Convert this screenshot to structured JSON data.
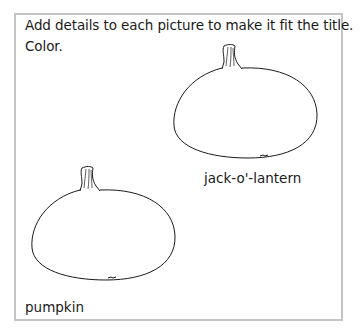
{
  "worksheet": {
    "instructions": {
      "line1": "Add details to each picture to make it fit the title.",
      "line2": "Color."
    },
    "pictures": [
      {
        "title": "jack-o'-lantern",
        "drawing": "pumpkin-outline-icon"
      },
      {
        "title": "pumpkin",
        "drawing": "pumpkin-outline-icon"
      }
    ],
    "colors": {
      "border": "#c4c4c4",
      "line": "#1a1a1a",
      "background": "#ffffff"
    }
  }
}
